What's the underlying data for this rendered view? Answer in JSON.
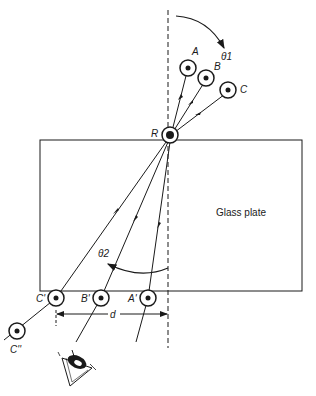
{
  "diagram": {
    "type": "optics-refraction-figure",
    "plate_label": "Glass plate",
    "angle_labels": {
      "incident": "θ1",
      "refracted": "θ2"
    },
    "distance_label": "d",
    "refraction_point": "R",
    "pins_above": [
      {
        "id": "A",
        "label": "A"
      },
      {
        "id": "B",
        "label": "B"
      },
      {
        "id": "C",
        "label": "C"
      }
    ],
    "pins_below": [
      {
        "id": "A'",
        "label": "A'"
      },
      {
        "id": "B'",
        "label": "B'"
      },
      {
        "id": "C'",
        "label": "C'"
      }
    ],
    "extra_pin": {
      "id": "C''",
      "label": "C''"
    },
    "observer": "eye",
    "colors": {
      "ink": "#1a1a1a",
      "background": "#ffffff"
    }
  }
}
